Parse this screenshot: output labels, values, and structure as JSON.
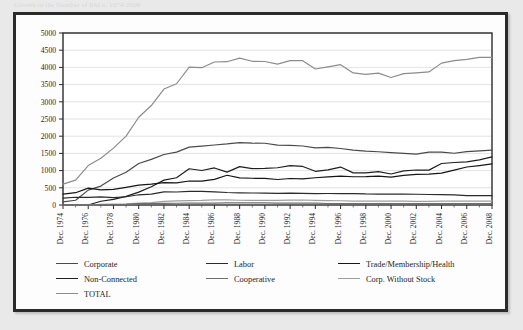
{
  "caption": {
    "text": "Growth in the Number of PACs, 1974-2008"
  },
  "chart_data": {
    "type": "line",
    "title": "",
    "subtitle": "",
    "xlabel": "",
    "ylabel": "",
    "grid": true,
    "legend_position": "bottom",
    "ylim": [
      0,
      5000
    ],
    "ytick_step": 500,
    "yticks": [
      "0",
      "500",
      "1000",
      "1500",
      "2000",
      "2500",
      "3000",
      "3500",
      "4000",
      "4500",
      "5000"
    ],
    "xlim": [
      "Dec. 1974",
      "Dec. 2008"
    ],
    "xticks": [
      "Dec. 1974",
      "Dec. 1976",
      "Dec. 1978",
      "Dec. 1980",
      "Dec. 1982",
      "Dec. 1984",
      "Dec. 1986",
      "Dec. 1988",
      "Dec. 1990",
      "Dec. 1992",
      "Dec. 1994",
      "Dec. 1996",
      "Dec. 1998",
      "Dec. 2000",
      "Dec. 2002",
      "Dec. 2004",
      "Dec. 2006",
      "Dec. 2008"
    ],
    "x": [
      1974,
      1975,
      1976,
      1977,
      1978,
      1979,
      1980,
      1981,
      1982,
      1983,
      1984,
      1985,
      1986,
      1987,
      1988,
      1989,
      1990,
      1991,
      1992,
      1993,
      1994,
      1995,
      1996,
      1997,
      1998,
      1999,
      2000,
      2001,
      2002,
      2003,
      2004,
      2005,
      2006,
      2007,
      2008
    ],
    "series": [
      {
        "name": "Corporate",
        "color": "#4a4a4a",
        "values": [
          89,
          139,
          433,
          550,
          785,
          950,
          1206,
          1327,
          1469,
          1538,
          1682,
          1710,
          1744,
          1775,
          1816,
          1796,
          1795,
          1738,
          1735,
          1715,
          1660,
          1674,
          1642,
          1597,
          1567,
          1548,
          1523,
          1500,
          1478,
          1538,
          1538,
          1505,
          1550,
          1575,
          1598
        ]
      },
      {
        "name": "Labor",
        "color": "#2b2b2b",
        "values": [
          201,
          226,
          224,
          234,
          217,
          240,
          297,
          318,
          380,
          378,
          394,
          396,
          384,
          364,
          354,
          349,
          346,
          338,
          347,
          337,
          333,
          334,
          332,
          332,
          321,
          318,
          316,
          315,
          313,
          305,
          302,
          297,
          273,
          273,
          272
        ]
      },
      {
        "name": "Trade/Membership/Health",
        "color": "#161616",
        "values": [
          318,
          357,
          489,
          438,
          453,
          514,
          576,
          607,
          649,
          643,
          698,
          694,
          745,
          865,
          786,
          777,
          774,
          742,
          770,
          761,
          792,
          815,
          838,
          821,
          825,
          838,
          812,
          861,
          888,
          896,
          926,
          1012,
          1104,
          1147,
          1197
        ]
      },
      {
        "name": "Non-Connected",
        "color": "#1f1f1f",
        "values": [
          0,
          0,
          0,
          110,
          162,
          250,
          374,
          531,
          723,
          793,
          1053,
          1003,
          1077,
          957,
          1115,
          1060,
          1062,
          1083,
          1145,
          1121,
          980,
          1020,
          1103,
          935,
          935,
          972,
          902,
          992,
          1018,
          1014,
          1206,
          1235,
          1255,
          1313,
          1400
        ]
      },
      {
        "name": "Cooperative",
        "color": "#6e6e6e",
        "values": [
          0,
          0,
          0,
          8,
          12,
          17,
          42,
          41,
          47,
          51,
          52,
          54,
          56,
          59,
          59,
          59,
          59,
          57,
          56,
          56,
          53,
          44,
          41,
          41,
          39,
          41,
          39,
          38,
          39,
          38,
          38,
          38,
          39,
          39,
          38
        ]
      },
      {
        "name": "Corp. Without Stock",
        "color": "#9e9e9e",
        "values": [
          0,
          0,
          0,
          20,
          24,
          32,
          56,
          68,
          103,
          122,
          130,
          135,
          151,
          151,
          138,
          137,
          136,
          136,
          142,
          146,
          136,
          129,
          123,
          113,
          115,
          114,
          114,
          110,
          107,
          104,
          114,
          112,
          113,
          115,
          115
        ]
      },
      {
        "name": "TOTAL",
        "color": "#8c8c8c",
        "values": [
          608,
          722,
          1146,
          1360,
          1653,
          2003,
          2551,
          2892,
          3371,
          3525,
          4009,
          3992,
          4157,
          4165,
          4268,
          4178,
          4172,
          4094,
          4195,
          4196,
          3954,
          4016,
          4079,
          3839,
          3798,
          3835,
          3706,
          3820,
          3843,
          3868,
          4124,
          4199,
          4234,
          4292,
          4292
        ]
      }
    ]
  },
  "legend": [
    {
      "label": "Corporate",
      "color": "#4a4a4a"
    },
    {
      "label": "Labor",
      "color": "#2b2b2b"
    },
    {
      "label": "Trade/Membership/Health",
      "color": "#161616"
    },
    {
      "label": "Non-Connected",
      "color": "#1f1f1f"
    },
    {
      "label": "Cooperative",
      "color": "#6e6e6e"
    },
    {
      "label": "Corp. Without Stock",
      "color": "#9e9e9e"
    },
    {
      "label": "TOTAL",
      "color": "#8c8c8c"
    }
  ]
}
